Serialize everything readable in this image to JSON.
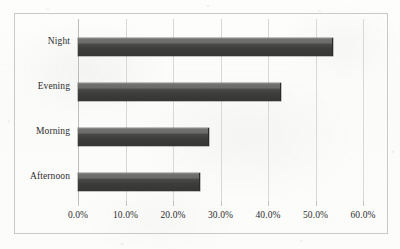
{
  "chart_data": {
    "type": "bar",
    "orientation": "horizontal",
    "title": "",
    "xlabel": "",
    "ylabel": "",
    "categories": [
      "Night",
      "Evening",
      "Morning",
      "Afternoon"
    ],
    "values": [
      53.5,
      42.5,
      27.4,
      25.5
    ],
    "value_format": "percent",
    "xlim": [
      0,
      60
    ],
    "xticks": [
      0,
      10,
      20,
      30,
      40,
      50,
      60
    ],
    "xtick_labels": [
      "0.0%",
      "10.0%",
      "20.0%",
      "30.0%",
      "40.0%",
      "50.0%",
      "60.0%"
    ],
    "grid": true,
    "grid_axis": "x",
    "legend": false,
    "series": [
      {
        "name": "Share",
        "values": [
          53.5,
          42.5,
          27.4,
          25.5
        ]
      }
    ],
    "colors": {
      "bar_face": "#3c3c3a",
      "bar_top": "#6b6b69",
      "gridline": "#d8d8d8",
      "frame": "#c9c9c9",
      "text": "#2c2c2c",
      "background": "#fbfbfa"
    }
  }
}
